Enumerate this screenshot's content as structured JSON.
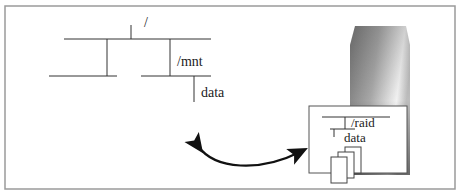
{
  "diagram": {
    "local_tree": {
      "root_label": "/",
      "mount_label": "/mnt",
      "data_label": "data"
    },
    "remote_tree": {
      "raid_label": "/raid",
      "data_label": "data"
    },
    "colors": {
      "border": "#9a9a9a",
      "line": "#333333",
      "arrow": "#111111",
      "server_dark": "#5a5a5a",
      "server_light": "#f0f0f0"
    }
  }
}
